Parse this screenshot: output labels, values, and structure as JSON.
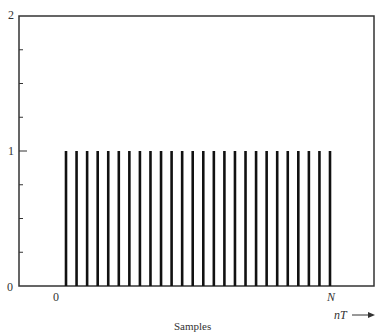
{
  "chart_data": {
    "type": "bar",
    "subtype": "stem",
    "title": "",
    "xlabel": "Samples",
    "x_axis_arrow_label": "nT",
    "ylabel": "",
    "ylim": [
      0,
      2
    ],
    "y_ticks": [
      0,
      1,
      2
    ],
    "y_minor_ticks": [
      0.25,
      0.5,
      0.75,
      1.25,
      1.5,
      1.75
    ],
    "x_tick_labels": [
      {
        "label": "0",
        "position": "start"
      },
      {
        "label": "N",
        "position": "end"
      }
    ],
    "n_samples": 26,
    "x": [
      0,
      1,
      2,
      3,
      4,
      5,
      6,
      7,
      8,
      9,
      10,
      11,
      12,
      13,
      14,
      15,
      16,
      17,
      18,
      19,
      20,
      21,
      22,
      23,
      24,
      25
    ],
    "values": [
      1,
      1,
      1,
      1,
      1,
      1,
      1,
      1,
      1,
      1,
      1,
      1,
      1,
      1,
      1,
      1,
      1,
      1,
      1,
      1,
      1,
      1,
      1,
      1,
      1,
      1
    ],
    "grid": false,
    "legend": null,
    "frame": "box"
  },
  "labels": {
    "y_top": "2",
    "y_mid": "1",
    "y_bottom": "0",
    "x_start": "0",
    "x_end": "N",
    "arrow_label": "nT",
    "xlabel": "Samples"
  },
  "colors": {
    "axis": "#333333",
    "stem": "#111111"
  }
}
